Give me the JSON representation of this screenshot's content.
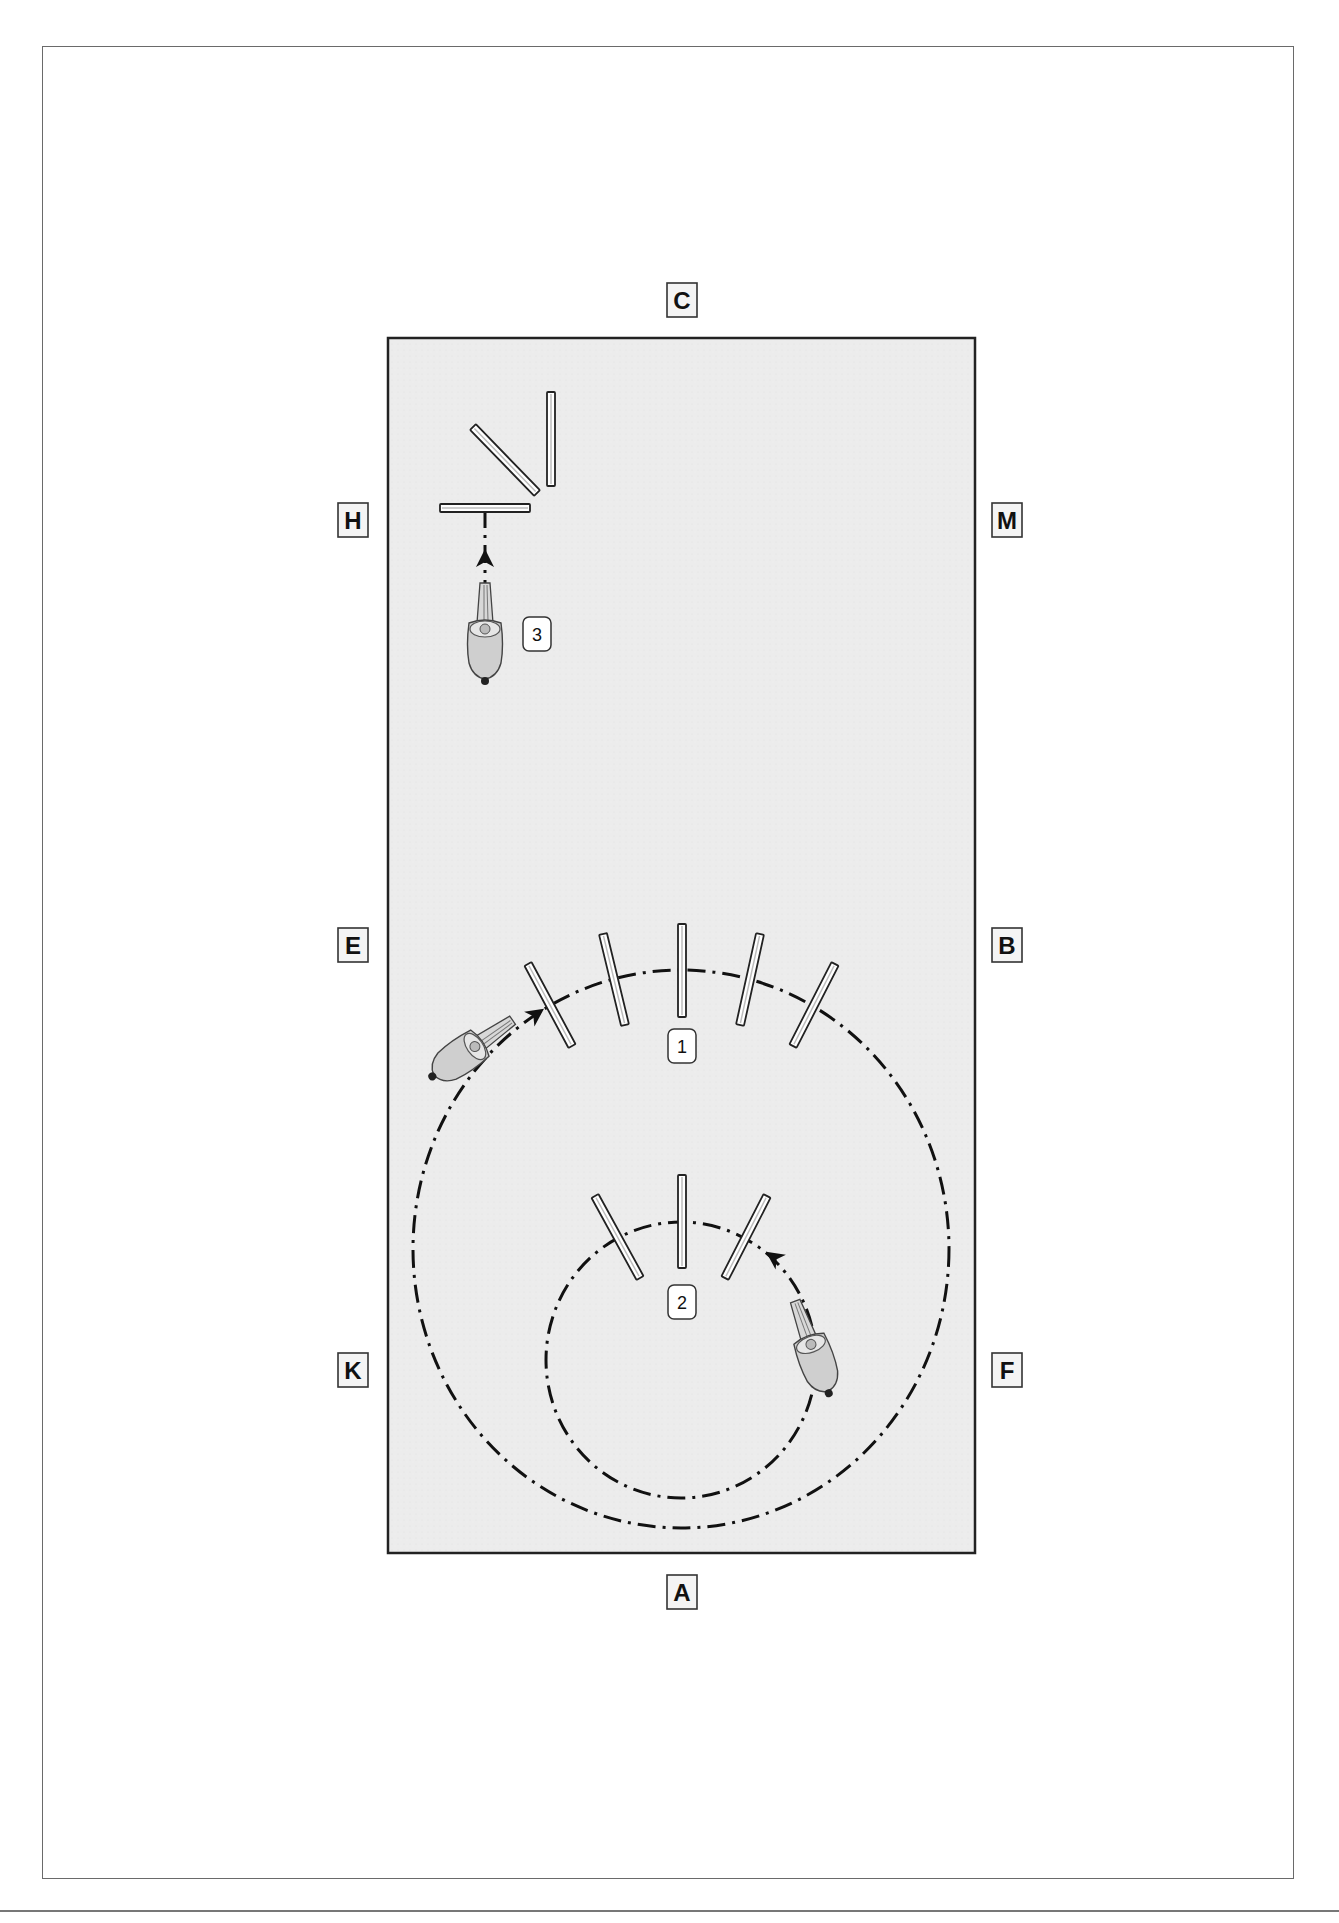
{
  "diagram": {
    "type": "dressage arena exercise diagram",
    "arena": {
      "left": 388,
      "top": 338,
      "right": 975,
      "bottom": 1553,
      "fill": "#ececec",
      "stroke": "#222222"
    },
    "markers": [
      {
        "letter": "C",
        "x": 682,
        "y": 300
      },
      {
        "letter": "H",
        "x": 353,
        "y": 520
      },
      {
        "letter": "M",
        "x": 1007,
        "y": 520
      },
      {
        "letter": "E",
        "x": 353,
        "y": 945
      },
      {
        "letter": "B",
        "x": 1007,
        "y": 945
      },
      {
        "letter": "K",
        "x": 353,
        "y": 1370
      },
      {
        "letter": "F",
        "x": 1007,
        "y": 1370
      },
      {
        "letter": "A",
        "x": 682,
        "y": 1592
      }
    ],
    "exercises": [
      {
        "number": "1",
        "label_x": 682,
        "label_y": 1046,
        "description": "Large circle over five fanned poles"
      },
      {
        "number": "2",
        "label_x": 682,
        "label_y": 1302,
        "description": "Small circle over three fanned poles"
      },
      {
        "number": "3",
        "label_x": 537,
        "label_y": 634,
        "description": "Straight approach to poles near H"
      }
    ],
    "paths": {
      "large_circle": {
        "cx": 681,
        "cy": 1249,
        "rx": 268,
        "ry": 279
      },
      "small_circle": {
        "cx": 681,
        "cy": 1360,
        "rx": 135,
        "ry": 138
      },
      "straight_line": {
        "x": 485,
        "x1": 485,
        "y1": 510,
        "y2": 600
      }
    },
    "poles": {
      "large_fan": [
        {
          "x1": 528,
          "y1": 964,
          "x2": 572,
          "y2": 1046
        },
        {
          "x1": 603,
          "y1": 934,
          "x2": 625,
          "y2": 1025
        },
        {
          "x1": 682,
          "y1": 924,
          "x2": 682,
          "y2": 1017
        },
        {
          "x1": 760,
          "y1": 934,
          "x2": 740,
          "y2": 1025
        },
        {
          "x1": 835,
          "y1": 964,
          "x2": 793,
          "y2": 1046
        }
      ],
      "small_fan": [
        {
          "x1": 595,
          "y1": 1196,
          "x2": 640,
          "y2": 1278
        },
        {
          "x1": 682,
          "y1": 1175,
          "x2": 682,
          "y2": 1268
        },
        {
          "x1": 767,
          "y1": 1196,
          "x2": 725,
          "y2": 1278
        }
      ],
      "corner_set": [
        {
          "x1": 551,
          "y1": 392,
          "x2": 551,
          "y2": 486
        },
        {
          "x1": 473,
          "y1": 427,
          "x2": 537,
          "y2": 493
        },
        {
          "x1": 440,
          "y1": 508,
          "x2": 530,
          "y2": 508
        }
      ]
    },
    "horses": [
      {
        "id": "horse-1",
        "x": 470,
        "y": 1050,
        "rotate": 55
      },
      {
        "id": "horse-2",
        "x": 813,
        "y": 1350,
        "rotate": -20
      },
      {
        "id": "horse-3",
        "x": 485,
        "y": 635,
        "rotate": 0
      }
    ],
    "direction_arrows": [
      {
        "x": 535,
        "y": 1015,
        "rotate": 55
      },
      {
        "x": 775,
        "y": 1258,
        "rotate": -55
      },
      {
        "x": 485,
        "y": 560,
        "rotate": 0
      }
    ]
  }
}
